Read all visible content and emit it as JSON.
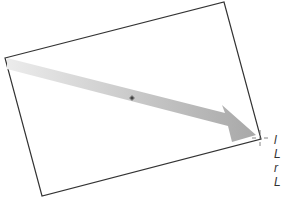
{
  "diagram": {
    "frame": {
      "corners": [
        [
          5,
          58
        ],
        [
          224,
          2
        ],
        [
          261,
          139
        ],
        [
          42,
          196
        ]
      ],
      "stroke": "#333333"
    },
    "arrow": {
      "shaft_start_color": "#ececec",
      "shaft_end_color": "#a8a8a8",
      "tip": [
        255,
        135
      ]
    },
    "center_marker": {
      "x": 132,
      "y": 98,
      "icon": "center-point-icon"
    },
    "crosshair": {
      "x": 260,
      "y": 138,
      "icon": "crosshair-icon"
    },
    "edge_text_lines": [
      "l",
      "L",
      "r",
      "L"
    ]
  }
}
